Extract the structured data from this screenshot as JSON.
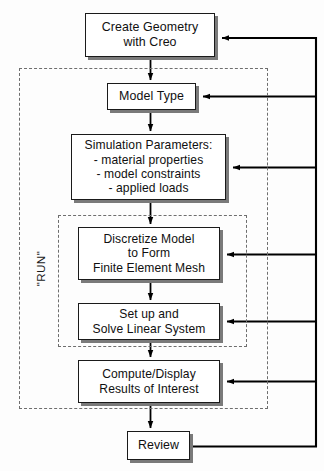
{
  "diagram": {
    "nodes": [
      {
        "id": "create",
        "label": "Create Geometry\nwith  Creo"
      },
      {
        "id": "modeltype",
        "label": "Model Type"
      },
      {
        "id": "simparams",
        "label": "Simulation Parameters:\n- material properties\n- model constraints\n- applied loads"
      },
      {
        "id": "discretize",
        "label": "Discretize Model\nto Form\nFinite Element Mesh"
      },
      {
        "id": "solve",
        "label": "Set up and\nSolve Linear System"
      },
      {
        "id": "compute",
        "label": "Compute/Display\nResults of Interest"
      },
      {
        "id": "review",
        "label": "Review"
      }
    ],
    "groups": [
      {
        "id": "outer",
        "label": ""
      },
      {
        "id": "run",
        "label": "\"RUN\""
      }
    ],
    "colors": {
      "box_fill": "#ffffff",
      "box_stroke": "#1a1a1a",
      "box_shadow": "#7a7a7a",
      "connector": "#000000",
      "dashed_group": "#6e6e6e",
      "background": "#fdfdfd"
    }
  }
}
